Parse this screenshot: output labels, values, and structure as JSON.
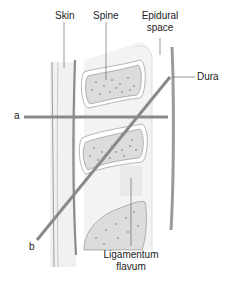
{
  "labels": {
    "skin": "Skin",
    "spine": "Spine",
    "epidural_line1": "Epidural",
    "epidural_line2": "space",
    "dura": "Dura",
    "needle_a": "a",
    "needle_b": "b",
    "ligamentum_line1": "Ligamentum",
    "ligamentum_line2": "flavum"
  },
  "colors": {
    "needle": "#8a8a8a",
    "dura": "#9a9a9a",
    "bone_fill": "#dedede",
    "tissue_fill": "#efefef",
    "leader": "#555555"
  }
}
